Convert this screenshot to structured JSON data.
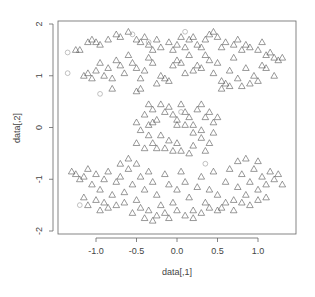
{
  "chart_data": {
    "type": "scatter",
    "title": "",
    "xlabel": "data[,1]",
    "ylabel": "data[,2]",
    "xlim": [
      -1.4,
      1.45
    ],
    "ylim": [
      -2.05,
      2.05
    ],
    "xticks": [
      -1.0,
      -0.5,
      0.0,
      0.5,
      1.0
    ],
    "xtick_labels": [
      "-1.0",
      "-0.5",
      "0.0",
      "0.5",
      "1.0"
    ],
    "yticks": [
      -2,
      -1,
      0,
      1,
      2
    ],
    "ytick_labels": [
      "-2",
      "-1",
      "0",
      "1",
      "2"
    ],
    "grid": false,
    "legend": "none",
    "series": [
      {
        "name": "class-triangle",
        "marker": "triangle",
        "color": "#555555",
        "points": [
          [
            -1.25,
            1.5
          ],
          [
            -1.2,
            1.5
          ],
          [
            -1.1,
            1.65
          ],
          [
            -1.05,
            1.7
          ],
          [
            -1.0,
            1.65
          ],
          [
            -0.95,
            1.6
          ],
          [
            -0.85,
            1.7
          ],
          [
            -0.75,
            1.8
          ],
          [
            -0.7,
            1.75
          ],
          [
            -0.6,
            1.85
          ],
          [
            -0.5,
            1.7
          ],
          [
            -0.45,
            1.65
          ],
          [
            -0.4,
            1.75
          ],
          [
            -0.35,
            1.6
          ],
          [
            -0.3,
            1.5
          ],
          [
            -0.25,
            1.7
          ],
          [
            -0.2,
            1.55
          ],
          [
            -0.1,
            1.65
          ],
          [
            -0.05,
            1.5
          ],
          [
            0.0,
            1.6
          ],
          [
            0.05,
            1.75
          ],
          [
            0.1,
            1.55
          ],
          [
            0.15,
            1.7
          ],
          [
            0.2,
            1.75
          ],
          [
            0.25,
            1.6
          ],
          [
            0.3,
            1.55
          ],
          [
            0.35,
            1.7
          ],
          [
            0.4,
            1.8
          ],
          [
            0.45,
            1.85
          ],
          [
            0.5,
            1.75
          ],
          [
            0.55,
            1.55
          ],
          [
            0.6,
            1.65
          ],
          [
            0.7,
            1.6
          ],
          [
            0.75,
            1.7
          ],
          [
            0.8,
            1.5
          ],
          [
            0.85,
            1.6
          ],
          [
            0.9,
            1.55
          ],
          [
            1.0,
            1.5
          ],
          [
            1.05,
            1.65
          ],
          [
            1.1,
            1.4
          ],
          [
            1.15,
            1.45
          ],
          [
            1.2,
            1.35
          ],
          [
            1.25,
            1.3
          ],
          [
            1.3,
            1.35
          ],
          [
            -1.15,
            1.0
          ],
          [
            -1.1,
            1.05
          ],
          [
            -1.05,
            0.95
          ],
          [
            -1.0,
            1.1
          ],
          [
            -0.95,
            1.25
          ],
          [
            -0.9,
            1.0
          ],
          [
            -0.85,
            1.15
          ],
          [
            -0.8,
            0.95
          ],
          [
            -0.75,
            1.3
          ],
          [
            -0.7,
            1.2
          ],
          [
            -0.65,
            1.05
          ],
          [
            -0.6,
            1.4
          ],
          [
            -0.55,
            1.25
          ],
          [
            -0.5,
            1.15
          ],
          [
            -0.45,
            0.95
          ],
          [
            -0.4,
            1.1
          ],
          [
            -0.35,
            1.35
          ],
          [
            -0.3,
            1.25
          ],
          [
            -0.25,
            0.85
          ],
          [
            -0.2,
            1.0
          ],
          [
            -0.15,
            0.95
          ],
          [
            -0.1,
            0.9
          ],
          [
            -0.05,
            1.2
          ],
          [
            0.0,
            1.3
          ],
          [
            0.05,
            1.25
          ],
          [
            0.1,
            1.05
          ],
          [
            0.15,
            1.4
          ],
          [
            0.2,
            1.1
          ],
          [
            0.25,
            1.2
          ],
          [
            0.3,
            1.15
          ],
          [
            0.35,
            1.4
          ],
          [
            0.4,
            1.3
          ],
          [
            0.45,
            1.05
          ],
          [
            0.5,
            1.25
          ],
          [
            0.55,
            0.9
          ],
          [
            0.6,
            0.85
          ],
          [
            0.65,
            1.1
          ],
          [
            0.7,
            1.35
          ],
          [
            0.75,
            0.95
          ],
          [
            0.8,
            0.8
          ],
          [
            0.85,
            1.15
          ],
          [
            0.9,
            0.85
          ],
          [
            0.95,
            1.0
          ],
          [
            1.0,
            0.9
          ],
          [
            1.05,
            1.2
          ],
          [
            1.1,
            1.15
          ],
          [
            1.2,
            1.0
          ],
          [
            -0.5,
            0.7
          ],
          [
            -0.45,
            0.75
          ],
          [
            -0.8,
            0.75
          ],
          [
            0.55,
            0.75
          ],
          [
            0.65,
            0.8
          ],
          [
            -0.35,
            0.45
          ],
          [
            -0.3,
            0.35
          ],
          [
            -0.3,
            0.1
          ],
          [
            -0.35,
            0.05
          ],
          [
            -0.35,
            -0.15
          ],
          [
            -0.3,
            -0.3
          ],
          [
            -0.25,
            -0.4
          ],
          [
            -0.2,
            0.45
          ],
          [
            -0.15,
            0.3
          ],
          [
            -0.1,
            0.4
          ],
          [
            -0.05,
            0.25
          ],
          [
            0.0,
            0.15
          ],
          [
            0.05,
            0.45
          ],
          [
            0.1,
            0.3
          ],
          [
            0.1,
            0.05
          ],
          [
            0.15,
            0.2
          ],
          [
            0.2,
            0.05
          ],
          [
            0.2,
            -0.1
          ],
          [
            0.25,
            0.35
          ],
          [
            0.3,
            0.45
          ],
          [
            0.35,
            0.2
          ],
          [
            0.4,
            0.3
          ],
          [
            0.45,
            0.1
          ],
          [
            0.45,
            -0.1
          ],
          [
            0.4,
            -0.3
          ],
          [
            0.35,
            -0.45
          ],
          [
            0.3,
            -0.2
          ],
          [
            0.2,
            -0.35
          ],
          [
            0.15,
            -0.5
          ],
          [
            0.05,
            -0.45
          ],
          [
            0.0,
            -0.3
          ],
          [
            -0.05,
            -0.45
          ],
          [
            -0.1,
            -0.25
          ],
          [
            -0.15,
            -0.4
          ],
          [
            -0.2,
            -0.15
          ],
          [
            -0.25,
            0.15
          ],
          [
            -0.4,
            0.25
          ],
          [
            -0.45,
            -0.05
          ],
          [
            -0.5,
            0.1
          ],
          [
            -0.5,
            -0.3
          ],
          [
            -0.4,
            -0.4
          ],
          [
            0.0,
            0.05
          ],
          [
            0.3,
            -0.05
          ],
          [
            0.5,
            0.2
          ],
          [
            -1.3,
            -0.85
          ],
          [
            -1.25,
            -0.9
          ],
          [
            -1.2,
            -1.0
          ],
          [
            -1.15,
            -0.95
          ],
          [
            -1.1,
            -0.8
          ],
          [
            -1.05,
            -1.1
          ],
          [
            -1.0,
            -0.9
          ],
          [
            -0.95,
            -1.2
          ],
          [
            -0.9,
            -1.0
          ],
          [
            -0.85,
            -0.85
          ],
          [
            -0.8,
            -1.3
          ],
          [
            -0.75,
            -1.05
          ],
          [
            -0.7,
            -0.95
          ],
          [
            -0.65,
            -1.25
          ],
          [
            -0.6,
            -0.8
          ],
          [
            -0.55,
            -1.1
          ],
          [
            -0.5,
            -1.4
          ],
          [
            -0.45,
            -0.95
          ],
          [
            -0.4,
            -1.2
          ],
          [
            -0.35,
            -0.85
          ],
          [
            -0.3,
            -1.05
          ],
          [
            -0.25,
            -1.3
          ],
          [
            -0.2,
            -1.5
          ],
          [
            -0.15,
            -0.9
          ],
          [
            -0.1,
            -1.1
          ],
          [
            -0.05,
            -1.45
          ],
          [
            0.0,
            -1.2
          ],
          [
            0.05,
            -0.85
          ],
          [
            0.1,
            -1.05
          ],
          [
            0.15,
            -1.35
          ],
          [
            0.2,
            -1.6
          ],
          [
            0.25,
            -1.15
          ],
          [
            0.3,
            -0.95
          ],
          [
            0.35,
            -1.45
          ],
          [
            0.4,
            -1.2
          ],
          [
            0.45,
            -0.85
          ],
          [
            0.5,
            -1.3
          ],
          [
            0.55,
            -1.55
          ],
          [
            0.6,
            -1.05
          ],
          [
            0.65,
            -0.8
          ],
          [
            0.7,
            -1.4
          ],
          [
            0.75,
            -1.15
          ],
          [
            0.8,
            -0.9
          ],
          [
            0.85,
            -1.3
          ],
          [
            0.9,
            -1.05
          ],
          [
            0.95,
            -0.8
          ],
          [
            1.0,
            -1.2
          ],
          [
            1.05,
            -0.95
          ],
          [
            1.1,
            -1.1
          ],
          [
            1.15,
            -0.85
          ],
          [
            1.2,
            -1.0
          ],
          [
            1.25,
            -0.9
          ],
          [
            1.3,
            -1.1
          ],
          [
            -1.15,
            -1.35
          ],
          [
            -1.1,
            -1.5
          ],
          [
            -1.0,
            -1.4
          ],
          [
            -0.95,
            -1.6
          ],
          [
            -0.9,
            -1.45
          ],
          [
            -0.85,
            -1.55
          ],
          [
            -0.75,
            -1.5
          ],
          [
            -0.65,
            -1.45
          ],
          [
            -0.55,
            -1.65
          ],
          [
            -0.45,
            -1.55
          ],
          [
            -0.4,
            -1.75
          ],
          [
            -0.35,
            -1.6
          ],
          [
            -0.3,
            -1.8
          ],
          [
            -0.25,
            -1.7
          ],
          [
            -0.15,
            -1.65
          ],
          [
            -0.1,
            -1.75
          ],
          [
            0.0,
            -1.6
          ],
          [
            0.1,
            -1.7
          ],
          [
            0.2,
            -1.75
          ],
          [
            0.3,
            -1.65
          ],
          [
            0.4,
            -1.55
          ],
          [
            0.5,
            -1.6
          ],
          [
            0.6,
            -1.45
          ],
          [
            0.7,
            -1.6
          ],
          [
            0.8,
            -1.45
          ],
          [
            0.9,
            -1.5
          ],
          [
            1.0,
            -1.4
          ],
          [
            1.1,
            -1.35
          ],
          [
            -0.6,
            -0.6
          ],
          [
            -0.5,
            -0.7
          ],
          [
            -0.7,
            -0.7
          ],
          [
            0.75,
            -0.65
          ],
          [
            0.85,
            -0.6
          ],
          [
            1.0,
            -0.65
          ]
        ]
      },
      {
        "name": "class-circle",
        "marker": "circle",
        "color": "#999999",
        "points": [
          [
            -1.35,
            1.45
          ],
          [
            -1.35,
            1.05
          ],
          [
            -0.95,
            0.65
          ],
          [
            -0.55,
            1.8
          ],
          [
            -0.35,
            1.65
          ],
          [
            0.1,
            1.85
          ],
          [
            0.05,
            0.3
          ],
          [
            0.35,
            -0.7
          ],
          [
            -1.2,
            -1.5
          ]
        ]
      }
    ]
  }
}
